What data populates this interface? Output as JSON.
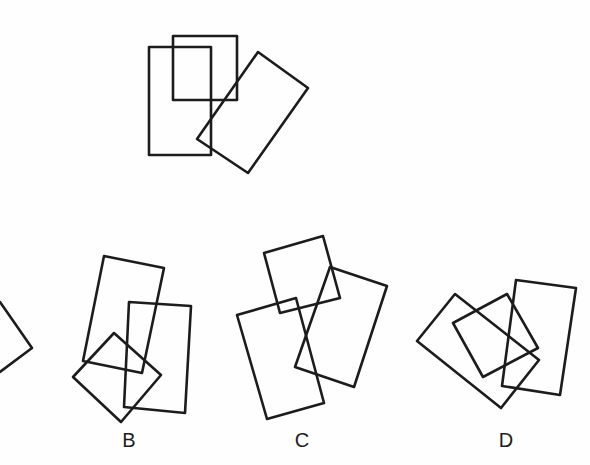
{
  "stroke_color": "#1c1c1c",
  "background_color": "#fefefe",
  "question_figure": {
    "shapes": [
      {
        "name": "tall-upright-rectangle",
        "points": "149,47 211,47 211,155 149,155"
      },
      {
        "name": "upper-square-rectangle",
        "points": "173,36 237,36 237,100 173,100"
      },
      {
        "name": "rotated-rectangle",
        "points": "258,52 308,88 248,173 197,139"
      }
    ]
  },
  "options": [
    {
      "label": "",
      "partial": true,
      "shapes": [
        {
          "name": "partial-shape",
          "type": "polyline",
          "points": "0,302 32,348 0,372"
        }
      ]
    },
    {
      "label": "B",
      "label_pos": {
        "x": 129,
        "y": 440
      },
      "shapes": [
        {
          "name": "tilted-tall-rectangle",
          "points": "104,256 164,268 142,373 83,361"
        },
        {
          "name": "near-upright-rectangle",
          "points": "129,302 191,306 185,413 124,407"
        },
        {
          "name": "diamond-square",
          "points": "114,333 161,375 121,422 73,377"
        }
      ]
    },
    {
      "label": "C",
      "label_pos": {
        "x": 302,
        "y": 440
      },
      "shapes": [
        {
          "name": "top-square",
          "points": "264,253 323,236 340,298 280,313"
        },
        {
          "name": "tall-lower-rectangle",
          "points": "237,315 296,298 324,403 267,419"
        },
        {
          "name": "tilted-right-rectangle",
          "points": "330,267 387,286 354,387 295,367"
        }
      ]
    },
    {
      "label": "D",
      "label_pos": {
        "x": 506,
        "y": 440
      },
      "shapes": [
        {
          "name": "upright-tilted-rectangle",
          "points": "516,280 576,288 560,395 502,386"
        },
        {
          "name": "large-tilted-rectangle",
          "points": "455,294 539,360 501,408 417,341"
        },
        {
          "name": "middle-rectangle",
          "points": "453,323 507,294 538,348 483,377"
        }
      ]
    }
  ]
}
